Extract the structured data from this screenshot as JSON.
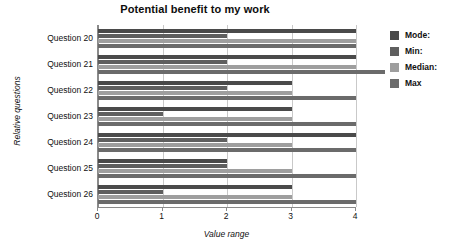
{
  "chart_data": {
    "type": "bar",
    "title": "Potential benefit to my work",
    "xlabel": "Value range",
    "ylabel": "Relative questions",
    "orientation": "horizontal",
    "grid": true,
    "legend_position": "right",
    "xlim": [
      0,
      4
    ],
    "xticks": [
      "0",
      "1",
      "2",
      "3",
      "4"
    ],
    "categories": [
      "Question 20",
      "Question 21",
      "Question 22",
      "Question 23",
      "Question 24",
      "Question 25",
      "Question 26"
    ],
    "series": [
      {
        "name": "Mode:",
        "color": "#4a4a4a",
        "values": [
          4,
          4,
          3,
          3,
          4,
          2,
          3
        ]
      },
      {
        "name": "Min:",
        "color": "#5f5f5f",
        "values": [
          2,
          2,
          2,
          1,
          2,
          2,
          1
        ]
      },
      {
        "name": "Median:",
        "color": "#9e9e9e",
        "values": [
          4,
          4,
          3,
          3,
          3,
          3,
          3
        ]
      },
      {
        "name": "Max",
        "color": "#6b6b6b",
        "values": [
          4,
          4.45,
          4,
          4,
          4,
          4,
          4
        ]
      }
    ]
  },
  "legend": {
    "items": [
      {
        "label": "Mode:",
        "color": "#4a4a4a"
      },
      {
        "label": "Min:",
        "color": "#5f5f5f"
      },
      {
        "label": "Median:",
        "color": "#9e9e9e"
      },
      {
        "label": "Max",
        "color": "#6b6b6b"
      }
    ]
  }
}
